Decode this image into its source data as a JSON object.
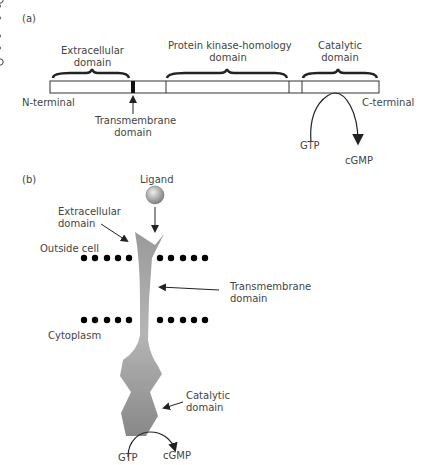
{
  "panel_a": {
    "label": "(a)",
    "domains": {
      "extracellular": [
        "Extracellular",
        "domain"
      ],
      "kinase": [
        "Protein kinase-homology",
        "domain"
      ],
      "catalytic": [
        "Catalytic",
        "domain"
      ],
      "transmembrane": [
        "Transmembrane",
        "domain"
      ]
    },
    "n_terminal": "N-terminal",
    "c_terminal": "C-terminal",
    "gtp": "GTP",
    "cgmp": "cGMP"
  },
  "panel_b": {
    "label": "(b)",
    "ligand": "Ligand",
    "extracellular": [
      "Extracellular",
      "domain"
    ],
    "outside_cell": "Outside cell",
    "transmembrane": [
      "Transmembrane",
      "domain"
    ],
    "cytoplasm": "Cytoplasm",
    "catalytic": [
      "Catalytic",
      "domain"
    ],
    "gtp": "GTP",
    "cgmp": "cGMP"
  },
  "colors": {
    "receptor": "#8a8a8a",
    "line": "#333333"
  }
}
